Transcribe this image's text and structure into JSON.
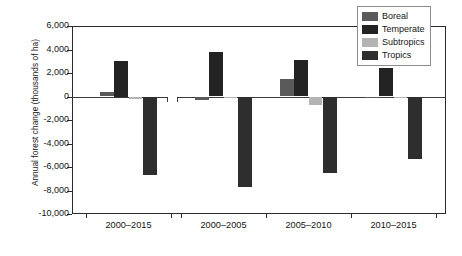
{
  "chart_data": {
    "type": "bar",
    "title": "",
    "xlabel": "",
    "ylabel": "Annual forest change (thousands of ha)",
    "categories": [
      "2000–2015",
      "2000–2005",
      "2005–2010",
      "2010–2015"
    ],
    "series": [
      {
        "name": "Boreal",
        "color": "#5a5a5a",
        "values": [
          380,
          -320,
          1450,
          -60
        ]
      },
      {
        "name": "Temperate",
        "color": "#232323",
        "values": [
          3000,
          3800,
          3100,
          2400
        ]
      },
      {
        "name": "Subtropics",
        "color": "#b4b4b4",
        "values": [
          -170,
          -90,
          -750,
          -130
        ]
      },
      {
        "name": "Tropics",
        "color": "#2e2e2e",
        "values": [
          -6700,
          -7700,
          -6500,
          -5300
        ]
      }
    ],
    "ylim": [
      -10000,
      6000
    ],
    "yticks": [
      "6,000",
      "4,000",
      "2,000",
      "0",
      "-2,000",
      "-4,000",
      "-6,000",
      "-8,000",
      "-10,000"
    ],
    "ytick_values": [
      6000,
      4000,
      2000,
      0,
      -2000,
      -4000,
      -6000,
      -8000,
      -10000
    ],
    "grid": false,
    "legend_position": "top-right",
    "legend_entries": [
      "Boreal",
      "Temperate",
      "Subtropics",
      "Tropics"
    ]
  },
  "legend": {
    "items": [
      {
        "label": "Boreal"
      },
      {
        "label": "Temperate"
      },
      {
        "label": "Subtropics"
      },
      {
        "label": "Tropics"
      }
    ]
  },
  "axes": {
    "y_title": "Annual forest change (thousands of ha)"
  }
}
